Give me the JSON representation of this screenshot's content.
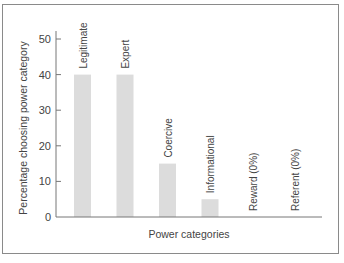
{
  "chart_data": {
    "type": "bar",
    "title": "",
    "xlabel": "Power categories",
    "ylabel": "Percentage choosing power category",
    "categories": [
      "Legitimate",
      "Expert",
      "Coercive",
      "Informational",
      "Reward (0%)",
      "Referent (0%)"
    ],
    "values": [
      40,
      40,
      15,
      5,
      0,
      0
    ],
    "ylim": [
      0,
      50
    ],
    "yticks": [
      0,
      10,
      20,
      30,
      40,
      50
    ],
    "grid": false,
    "legend": null,
    "bar_color": "#dcdcdc"
  }
}
